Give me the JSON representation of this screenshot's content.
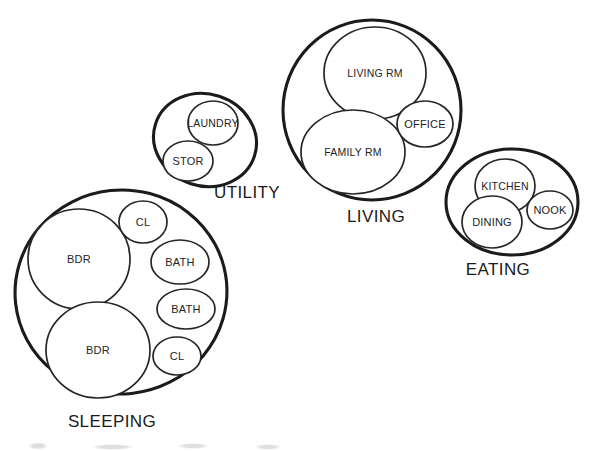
{
  "diagram": {
    "type": "bubble-diagram",
    "canvas": {
      "width": 589,
      "height": 451
    },
    "style": {
      "background": "#ffffff",
      "zone_stroke": "#1b1b1b",
      "room_stroke": "#262626",
      "text_color": "#1b1b1b"
    },
    "zones": [
      {
        "id": "sleeping",
        "label": "SLEEPING",
        "label_x": 112,
        "label_y": 427,
        "shape": {
          "cx": 121,
          "cy": 292,
          "rx": 106,
          "ry": 102,
          "rotate": -6
        },
        "rooms": [
          {
            "id": "bdr-upper",
            "label": "BDR",
            "cx": 79,
            "cy": 259,
            "rx": 51,
            "ry": 50,
            "rotate": 0
          },
          {
            "id": "bdr-lower",
            "label": "BDR",
            "cx": 98,
            "cy": 350,
            "rx": 52,
            "ry": 48,
            "rotate": 0
          },
          {
            "id": "cl-upper",
            "label": "CL",
            "cx": 143,
            "cy": 222,
            "rx": 24,
            "ry": 21,
            "rotate": 0
          },
          {
            "id": "bath-upper",
            "label": "BATH",
            "cx": 180,
            "cy": 262,
            "rx": 29,
            "ry": 22,
            "rotate": 0
          },
          {
            "id": "bath-lower",
            "label": "BATH",
            "cx": 186,
            "cy": 309,
            "rx": 29,
            "ry": 20,
            "rotate": 0
          },
          {
            "id": "cl-lower",
            "label": "CL",
            "cx": 177,
            "cy": 356,
            "rx": 24,
            "ry": 19,
            "rotate": 0
          }
        ]
      },
      {
        "id": "utility",
        "label": "UTILITY",
        "label_x": 247,
        "label_y": 198,
        "shape": {
          "cx": 205,
          "cy": 140,
          "rx": 52,
          "ry": 46,
          "rotate": 18
        },
        "rooms": [
          {
            "id": "laundry",
            "label": "LAUNDRY",
            "cx": 213,
            "cy": 123,
            "rx": 25,
            "ry": 22,
            "rotate": 0
          },
          {
            "id": "stor",
            "label": "STOR",
            "cx": 188,
            "cy": 161,
            "rx": 25,
            "ry": 20,
            "rotate": 0
          }
        ]
      },
      {
        "id": "living",
        "label": "LIVING",
        "label_x": 376,
        "label_y": 222,
        "shape": {
          "cx": 372,
          "cy": 110,
          "rx": 89,
          "ry": 90,
          "rotate": 0
        },
        "rooms": [
          {
            "id": "living-rm",
            "label": "LIVING RM",
            "cx": 375,
            "cy": 73,
            "rx": 51,
            "ry": 46,
            "rotate": 0
          },
          {
            "id": "family-rm",
            "label": "FAMILY RM",
            "cx": 353,
            "cy": 152,
            "rx": 52,
            "ry": 42,
            "rotate": 0
          },
          {
            "id": "office",
            "label": "OFFICE",
            "cx": 425,
            "cy": 124,
            "rx": 28,
            "ry": 23,
            "rotate": 0
          }
        ]
      },
      {
        "id": "eating",
        "label": "EATING",
        "label_x": 498,
        "label_y": 275,
        "shape": {
          "cx": 512,
          "cy": 202,
          "rx": 66,
          "ry": 53,
          "rotate": 0
        },
        "rooms": [
          {
            "id": "kitchen",
            "label": "KITCHEN",
            "cx": 505,
            "cy": 186,
            "rx": 30,
            "ry": 27,
            "rotate": 0
          },
          {
            "id": "dining",
            "label": "DINING",
            "cx": 492,
            "cy": 222,
            "rx": 30,
            "ry": 26,
            "rotate": 0
          },
          {
            "id": "nook",
            "label": "NOOK",
            "cx": 550,
            "cy": 210,
            "rx": 23,
            "ry": 19,
            "rotate": 0
          }
        ]
      }
    ]
  }
}
